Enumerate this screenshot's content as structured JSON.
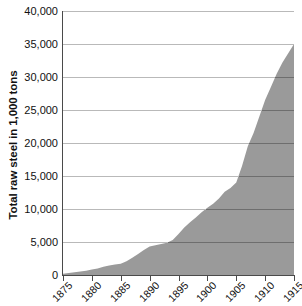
{
  "chart_data": {
    "type": "area",
    "title": "",
    "xlabel": "",
    "ylabel": "Total raw steel in 1,000 tons",
    "xlim": [
      1875,
      1915
    ],
    "ylim": [
      0,
      40000
    ],
    "grid": true,
    "legend": null,
    "series_color": "#9a9a9a",
    "gridline_color": "#b9b9b9",
    "axis_color": "#4a4a4a",
    "x_tick_labels": [
      "1875",
      "1880",
      "1885",
      "1890",
      "1895",
      "1900",
      "1905",
      "1910",
      "1915"
    ],
    "x_ticks": [
      1875,
      1880,
      1885,
      1890,
      1895,
      1900,
      1905,
      1910,
      1915
    ],
    "y_tick_labels": [
      "0",
      "5,000",
      "10,000",
      "15,000",
      "20,000",
      "25,000",
      "30,000",
      "35,000",
      "40,000"
    ],
    "y_ticks": [
      0,
      5000,
      10000,
      15000,
      20000,
      25000,
      30000,
      35000,
      40000
    ],
    "x": [
      1875,
      1876,
      1877,
      1878,
      1879,
      1880,
      1881,
      1882,
      1883,
      1884,
      1885,
      1886,
      1887,
      1888,
      1889,
      1890,
      1891,
      1892,
      1893,
      1894,
      1895,
      1896,
      1897,
      1898,
      1899,
      1900,
      1901,
      1902,
      1903,
      1904,
      1905,
      1906,
      1907,
      1908,
      1909,
      1910,
      1911,
      1912,
      1913,
      1914,
      1915
    ],
    "values": [
      200,
      300,
      420,
      540,
      660,
      820,
      1000,
      1250,
      1450,
      1600,
      1700,
      2100,
      2600,
      3200,
      3800,
      4300,
      4500,
      4700,
      4900,
      5300,
      6200,
      7200,
      8000,
      8700,
      9500,
      10200,
      10800,
      11600,
      12600,
      13200,
      14000,
      16500,
      19500,
      21500,
      24000,
      26500,
      28500,
      30500,
      32200,
      33600,
      35000
    ]
  },
  "axis": {
    "y_title": "Total raw steel in 1,000 tons"
  }
}
